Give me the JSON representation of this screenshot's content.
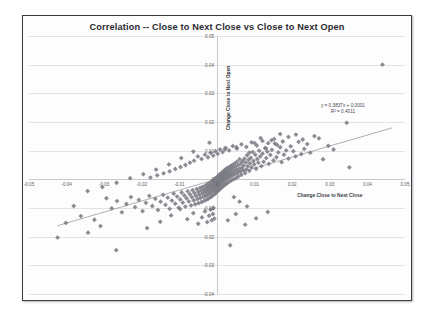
{
  "chart_data": {
    "type": "scatter",
    "title": "Correlation -- Close to Next Close vs Close to Next Open",
    "xlabel": "Change Close to Next Close",
    "ylabel": "Change Close to Next Open",
    "xlim": [
      -0.05,
      0.05
    ],
    "ylim": [
      -0.04,
      0.05
    ],
    "xticks": [
      -0.05,
      -0.04,
      -0.03,
      -0.02,
      -0.01,
      0,
      0.01,
      0.02,
      0.03,
      0.04,
      0.05
    ],
    "xtick_labels": [
      "-0.05",
      "-0.04",
      "-0.03",
      "-0.02",
      "-0.01",
      "0",
      "0.01",
      "0.02",
      "0.03",
      "0.04",
      "0.05"
    ],
    "yticks": [
      0.05,
      0.04,
      0.03,
      0.02,
      0.01,
      0,
      -0.01,
      -0.02,
      -0.03,
      -0.04
    ],
    "ytick_labels": [
      "0.05",
      "0.04",
      "0.03",
      "0.02",
      "0.01",
      "0",
      "-0.01",
      "-0.02",
      "-0.03",
      "-0.04"
    ],
    "grid": "horizontal",
    "legend": "none",
    "marker": "diamond",
    "marker_color": "#7b7b84",
    "marker_size": 2.4,
    "trendline": {
      "equation": "y = 0.3837x + 0.0001",
      "r_squared_label": "R² = 0.4011",
      "slope": 0.3837,
      "intercept": 0.0001,
      "r_squared": 0.4011,
      "color": "#8d8d96",
      "x_start": -0.0425,
      "x_end": 0.0465
    },
    "annotation_line1": "y = 0.3837x + 0.0001",
    "annotation_line2": "R² = 0.4011",
    "points": [
      [
        0.044,
        0.04
      ],
      [
        0.0345,
        0.0197
      ],
      [
        0.0352,
        0.0042
      ],
      [
        0.031,
        0.0104
      ],
      [
        0.0296,
        0.0117
      ],
      [
        0.0282,
        0.007
      ],
      [
        0.0271,
        0.0143
      ],
      [
        0.0259,
        0.0151
      ],
      [
        0.0248,
        0.0093
      ],
      [
        0.024,
        0.0123
      ],
      [
        0.0232,
        0.0106
      ],
      [
        0.0224,
        0.0088
      ],
      [
        0.0217,
        0.0131
      ],
      [
        0.0209,
        0.008
      ],
      [
        0.0203,
        0.0098
      ],
      [
        0.0196,
        0.0115
      ],
      [
        0.019,
        0.0072
      ],
      [
        0.0184,
        0.0101
      ],
      [
        0.0178,
        0.0086
      ],
      [
        0.0172,
        0.006
      ],
      [
        0.0168,
        0.0112
      ],
      [
        0.0163,
        0.0094
      ],
      [
        0.0158,
        0.0077
      ],
      [
        0.0154,
        0.0125
      ],
      [
        0.015,
        0.0066
      ],
      [
        0.0146,
        0.0103
      ],
      [
        0.0142,
        0.0085
      ],
      [
        0.0138,
        0.0054
      ],
      [
        0.0134,
        0.0097
      ],
      [
        0.0131,
        0.0074
      ],
      [
        0.0128,
        0.0109
      ],
      [
        0.0124,
        0.0061
      ],
      [
        0.0121,
        0.009
      ],
      [
        0.0118,
        0.0046
      ],
      [
        0.0115,
        0.008
      ],
      [
        0.0112,
        0.01
      ],
      [
        0.011,
        0.0058
      ],
      [
        0.0107,
        0.0071
      ],
      [
        0.0104,
        0.0037
      ],
      [
        0.0102,
        0.0086
      ],
      [
        0.0099,
        0.0052
      ],
      [
        0.0097,
        0.0064
      ],
      [
        0.0095,
        0.0095
      ],
      [
        0.0092,
        0.0042
      ],
      [
        0.009,
        0.0075
      ],
      [
        0.0088,
        0.0056
      ],
      [
        0.0086,
        0.003
      ],
      [
        0.0084,
        0.0068
      ],
      [
        0.0082,
        0.0046
      ],
      [
        0.008,
        0.0084
      ],
      [
        0.0078,
        0.0035
      ],
      [
        0.0077,
        0.0059
      ],
      [
        0.0075,
        0.0022
      ],
      [
        0.0073,
        0.0072
      ],
      [
        0.0071,
        0.0048
      ],
      [
        0.007,
        0.0031
      ],
      [
        0.0068,
        0.0063
      ],
      [
        0.0066,
        0.004
      ],
      [
        0.0065,
        0.0016
      ],
      [
        0.0063,
        0.0055
      ],
      [
        0.0062,
        0.0027
      ],
      [
        0.006,
        0.007
      ],
      [
        0.0059,
        0.0036
      ],
      [
        0.0057,
        0.001
      ],
      [
        0.0056,
        0.0049
      ],
      [
        0.0055,
        0.0023
      ],
      [
        0.0053,
        0.0061
      ],
      [
        0.0052,
        0.0033
      ],
      [
        0.0051,
        0.0005
      ],
      [
        0.0049,
        0.0044
      ],
      [
        0.0048,
        0.0018
      ],
      [
        0.0047,
        0.0055
      ],
      [
        0.0046,
        0.0029
      ],
      [
        0.0045,
        0.0001
      ],
      [
        0.0043,
        0.004
      ],
      [
        0.0042,
        0.0014
      ],
      [
        0.0041,
        0.005
      ],
      [
        0.004,
        0.0025
      ],
      [
        0.0039,
        -0.0003
      ],
      [
        0.0038,
        0.0036
      ],
      [
        0.0037,
        0.0011
      ],
      [
        0.0036,
        0.0046
      ],
      [
        0.0035,
        0.0021
      ],
      [
        0.0034,
        -0.0007
      ],
      [
        0.0033,
        0.0032
      ],
      [
        0.0032,
        0.0007
      ],
      [
        0.0031,
        0.0042
      ],
      [
        0.003,
        0.0017
      ],
      [
        0.0029,
        -0.0011
      ],
      [
        0.0028,
        0.0028
      ],
      [
        0.0027,
        0.0003
      ],
      [
        0.0026,
        0.0038
      ],
      [
        0.0026,
        0.0014
      ],
      [
        0.0025,
        -0.0015
      ],
      [
        0.0024,
        0.0024
      ],
      [
        0.0023,
        -0.0001
      ],
      [
        0.0022,
        0.0034
      ],
      [
        0.0022,
        0.001
      ],
      [
        0.0021,
        -0.0019
      ],
      [
        0.002,
        0.002
      ],
      [
        0.0019,
        -0.0005
      ],
      [
        0.0019,
        0.003
      ],
      [
        0.0018,
        0.0006
      ],
      [
        0.0017,
        -0.0023
      ],
      [
        0.0016,
        0.0016
      ],
      [
        0.0016,
        -0.0009
      ],
      [
        0.0015,
        0.0026
      ],
      [
        0.0014,
        0.0002
      ],
      [
        0.0014,
        -0.0027
      ],
      [
        0.0013,
        0.0012
      ],
      [
        0.0012,
        -0.0013
      ],
      [
        0.0012,
        0.0022
      ],
      [
        0.0011,
        -0.0002
      ],
      [
        0.001,
        -0.0031
      ],
      [
        0.001,
        0.0008
      ],
      [
        0.0009,
        -0.0017
      ],
      [
        0.0008,
        0.0018
      ],
      [
        0.0008,
        -0.0006
      ],
      [
        0.0007,
        -0.0035
      ],
      [
        0.0006,
        0.0004
      ],
      [
        0.0006,
        -0.0021
      ],
      [
        0.0005,
        0.0014
      ],
      [
        0.0004,
        -0.001
      ],
      [
        0.0004,
        -0.0039
      ],
      [
        0.0003,
        0.0
      ],
      [
        0.0002,
        -0.0025
      ],
      [
        0.0002,
        0.001
      ],
      [
        0.0001,
        -0.0014
      ],
      [
        0.0,
        -0.0043
      ],
      [
        0.0,
        -0.0004
      ],
      [
        -0.0001,
        -0.0029
      ],
      [
        -0.0002,
        0.0006
      ],
      [
        -0.0002,
        -0.0018
      ],
      [
        -0.0003,
        -0.0047
      ],
      [
        -0.0004,
        -0.0008
      ],
      [
        -0.0004,
        -0.0033
      ],
      [
        -0.0005,
        0.0002
      ],
      [
        -0.0006,
        -0.0022
      ],
      [
        -0.0006,
        -0.0051
      ],
      [
        -0.0007,
        -0.0012
      ],
      [
        -0.0008,
        -0.0037
      ],
      [
        -0.0008,
        -0.0002
      ],
      [
        -0.0009,
        -0.0026
      ],
      [
        -0.001,
        -0.0055
      ],
      [
        -0.0011,
        -0.0016
      ],
      [
        -0.0012,
        -0.0041
      ],
      [
        -0.0012,
        -0.0006
      ],
      [
        -0.0013,
        -0.003
      ],
      [
        -0.0014,
        -0.0059
      ],
      [
        -0.0015,
        -0.002
      ],
      [
        -0.0016,
        -0.0045
      ],
      [
        -0.0016,
        -0.001
      ],
      [
        -0.0017,
        -0.0034
      ],
      [
        -0.0018,
        -0.0063
      ],
      [
        -0.0019,
        -0.0024
      ],
      [
        -0.002,
        -0.0049
      ],
      [
        -0.0021,
        -0.0014
      ],
      [
        -0.0022,
        -0.0038
      ],
      [
        -0.0023,
        -0.0067
      ],
      [
        -0.0024,
        -0.0028
      ],
      [
        -0.0025,
        -0.0053
      ],
      [
        -0.0026,
        -0.0018
      ],
      [
        -0.0027,
        -0.0042
      ],
      [
        -0.0028,
        -0.0071
      ],
      [
        -0.0029,
        -0.0032
      ],
      [
        -0.003,
        -0.0057
      ],
      [
        -0.0031,
        -0.0022
      ],
      [
        -0.0033,
        -0.0046
      ],
      [
        -0.0034,
        -0.0075
      ],
      [
        -0.0035,
        -0.0036
      ],
      [
        -0.0036,
        -0.0061
      ],
      [
        -0.0038,
        -0.0026
      ],
      [
        -0.0039,
        -0.005
      ],
      [
        -0.0041,
        -0.0079
      ],
      [
        -0.0042,
        -0.004
      ],
      [
        -0.0044,
        -0.0065
      ],
      [
        -0.0045,
        -0.003
      ],
      [
        -0.0047,
        -0.0054
      ],
      [
        -0.0049,
        -0.0083
      ],
      [
        -0.005,
        -0.0044
      ],
      [
        -0.0052,
        -0.0069
      ],
      [
        -0.0054,
        -0.0034
      ],
      [
        -0.0056,
        -0.0058
      ],
      [
        -0.0058,
        -0.0087
      ],
      [
        -0.006,
        -0.0048
      ],
      [
        -0.0062,
        -0.0073
      ],
      [
        -0.0065,
        -0.0038
      ],
      [
        -0.0067,
        -0.0062
      ],
      [
        -0.0069,
        -0.0091
      ],
      [
        -0.0072,
        -0.0052
      ],
      [
        -0.0075,
        -0.0077
      ],
      [
        -0.0078,
        -0.0042
      ],
      [
        -0.0081,
        -0.0066
      ],
      [
        -0.0084,
        -0.0095
      ],
      [
        -0.0087,
        -0.0056
      ],
      [
        -0.0091,
        -0.0081
      ],
      [
        -0.0094,
        -0.0046
      ],
      [
        -0.0098,
        -0.007
      ],
      [
        -0.0102,
        -0.0099
      ],
      [
        -0.0106,
        -0.006
      ],
      [
        -0.0111,
        -0.0085
      ],
      [
        -0.0115,
        -0.005
      ],
      [
        -0.012,
        -0.0074
      ],
      [
        -0.0126,
        -0.0103
      ],
      [
        -0.0131,
        -0.0064
      ],
      [
        -0.0137,
        -0.0089
      ],
      [
        -0.0143,
        -0.0054
      ],
      [
        -0.015,
        -0.0078
      ],
      [
        -0.0157,
        -0.0107
      ],
      [
        -0.0164,
        -0.0068
      ],
      [
        -0.0172,
        -0.0093
      ],
      [
        -0.018,
        -0.0058
      ],
      [
        -0.0189,
        -0.0082
      ],
      [
        -0.0198,
        -0.0111
      ],
      [
        -0.0208,
        -0.0072
      ],
      [
        -0.0218,
        -0.0097
      ],
      [
        -0.0229,
        -0.0062
      ],
      [
        -0.0241,
        -0.0086
      ],
      [
        -0.0253,
        -0.0115
      ],
      [
        -0.0266,
        -0.0076
      ],
      [
        -0.028,
        -0.0101
      ],
      [
        -0.0294,
        -0.0066
      ],
      [
        -0.031,
        -0.0163
      ],
      [
        -0.0326,
        -0.0141
      ],
      [
        -0.0343,
        -0.0186
      ],
      [
        -0.0362,
        -0.0128
      ],
      [
        -0.0381,
        -0.0093
      ],
      [
        -0.0402,
        -0.0152
      ],
      [
        -0.0424,
        -0.0203
      ],
      [
        -0.0268,
        -0.0247
      ],
      [
        -0.0186,
        -0.017
      ],
      [
        -0.0151,
        -0.0148
      ],
      [
        -0.0122,
        -0.0126
      ],
      [
        -0.0098,
        -0.0104
      ],
      [
        -0.0079,
        -0.0139
      ],
      [
        -0.0063,
        -0.0118
      ],
      [
        -0.005,
        -0.0155
      ],
      [
        -0.004,
        -0.0133
      ],
      [
        -0.0032,
        -0.0112
      ],
      [
        -0.0026,
        -0.0149
      ],
      [
        -0.0021,
        -0.0127
      ],
      [
        -0.0017,
        -0.0106
      ],
      [
        -0.0014,
        -0.0143
      ],
      [
        -0.0011,
        -0.0121
      ],
      [
        -0.0009,
        -0.01
      ],
      [
        -0.0007,
        -0.0137
      ],
      [
        0.0029,
        -0.0143
      ],
      [
        0.005,
        -0.0121
      ],
      [
        0.0075,
        -0.0158
      ],
      [
        0.0104,
        -0.0136
      ],
      [
        0.0135,
        -0.0114
      ],
      [
        0.008,
        -0.0094
      ],
      [
        0.006,
        -0.0078
      ],
      [
        0.0045,
        -0.0062
      ],
      [
        0.0035,
        -0.023
      ],
      [
        0.0052,
        0.0112
      ],
      [
        0.0021,
        0.0105
      ],
      [
        -0.002,
        0.0128
      ],
      [
        -0.0063,
        0.0097
      ],
      [
        -0.0095,
        0.0074
      ],
      [
        -0.0128,
        0.0052
      ],
      [
        -0.0162,
        0.0034
      ],
      [
        -0.0196,
        0.0018
      ],
      [
        -0.0231,
        0.0004
      ],
      [
        -0.0267,
        -0.0012
      ],
      [
        -0.0305,
        -0.0027
      ],
      [
        -0.0344,
        -0.0041
      ],
      [
        0.0168,
        0.0158
      ],
      [
        0.0152,
        0.0141
      ],
      [
        0.0136,
        0.0126
      ],
      [
        0.0121,
        0.0134
      ],
      [
        0.0106,
        0.0118
      ],
      [
        0.0092,
        0.0129
      ],
      [
        0.0078,
        0.0113
      ],
      [
        0.0065,
        0.0122
      ],
      [
        0.0053,
        0.0107
      ],
      [
        0.0042,
        0.0116
      ],
      [
        0.0032,
        0.0101
      ],
      [
        0.0023,
        0.011
      ],
      [
        0.0015,
        0.0095
      ],
      [
        0.0008,
        0.0104
      ],
      [
        0.0002,
        0.0089
      ],
      [
        -0.0004,
        0.0098
      ],
      [
        -0.001,
        0.0083
      ],
      [
        -0.0017,
        0.0092
      ],
      [
        -0.0024,
        0.0077
      ],
      [
        -0.0032,
        0.0086
      ],
      [
        -0.0041,
        0.0071
      ],
      [
        -0.0051,
        0.008
      ],
      [
        -0.0061,
        0.0065
      ],
      [
        -0.0072,
        0.0058
      ],
      [
        -0.0084,
        0.005
      ],
      [
        -0.0097,
        0.0043
      ],
      [
        -0.0111,
        0.0036
      ],
      [
        -0.0126,
        0.0028
      ],
      [
        -0.0142,
        0.0021
      ],
      [
        -0.0159,
        0.0014
      ],
      [
        -0.0177,
        0.0006
      ],
      [
        0.021,
        0.0156
      ],
      [
        0.0228,
        0.0139
      ],
      [
        0.019,
        0.0148
      ],
      [
        0.0175,
        0.0132
      ],
      [
        0.016,
        0.012
      ],
      [
        0.0145,
        0.0136
      ],
      [
        0.013,
        0.0108
      ],
      [
        0.0116,
        0.0144
      ],
      [
        0.01,
        0.0126
      ],
      [
        0.0086,
        0.0093
      ]
    ]
  }
}
